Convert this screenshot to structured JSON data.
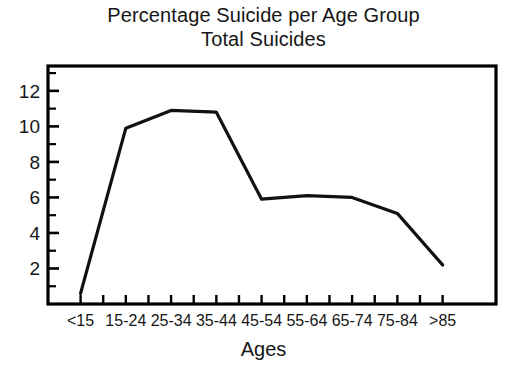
{
  "chart_data": {
    "type": "line",
    "title": "Percentage Suicide per Age Group",
    "subtitle": "Total Suicides",
    "xlabel": "Ages",
    "ylabel": "",
    "categories": [
      "<15",
      "15-24",
      "25-34",
      "35-44",
      "45-54",
      "55-64",
      "65-74",
      "75-84",
      ">85"
    ],
    "values": [
      0.6,
      9.9,
      10.9,
      10.8,
      5.9,
      6.1,
      6.0,
      5.1,
      2.2
    ],
    "ylim": [
      0,
      13.4
    ],
    "ytick_values": [
      2,
      4,
      6,
      8,
      10,
      12
    ],
    "ytick_labels": [
      "2",
      "4",
      "6",
      "8",
      "10",
      "12"
    ],
    "yminor_step": 1,
    "grid": false,
    "legend": null,
    "line_color": "#111111",
    "line_width": 3.2,
    "frame_color": "#000000"
  },
  "figure": {
    "title_line1": "Percentage Suicide per Age Group",
    "title_line2": "Total Suicides",
    "xaxis_title": "Ages",
    "background": "#ffffff"
  }
}
